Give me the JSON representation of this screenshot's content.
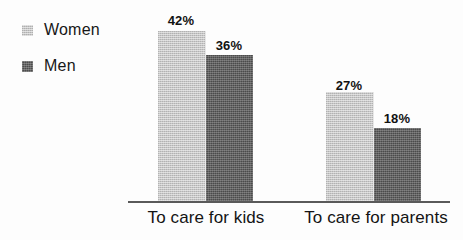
{
  "chart_data": {
    "type": "bar",
    "title": "",
    "subtitle": "",
    "xlabel": "",
    "ylabel": "",
    "grid": false,
    "legend_position": "top-left",
    "ylim": [
      0,
      45
    ],
    "categories": [
      "To care for kids",
      "To care for parents"
    ],
    "series": [
      {
        "name": "Women",
        "color": "#c6c6c6",
        "values": [
          42,
          27
        ],
        "value_labels": [
          "42%",
          "36%"
        ]
      },
      {
        "name": "Men",
        "color": "#4b4b4b",
        "values": [
          36,
          18
        ],
        "value_labels": [
          "27%",
          "18%"
        ]
      }
    ],
    "bars": [
      {
        "group": "To care for kids",
        "series": "Women",
        "value": 42,
        "label": "42%"
      },
      {
        "group": "To care for kids",
        "series": "Men",
        "value": 36,
        "label": "36%"
      },
      {
        "group": "To care for parents",
        "series": "Women",
        "value": 27,
        "label": "27%"
      },
      {
        "group": "To care for parents",
        "series": "Men",
        "value": 18,
        "label": "18%"
      }
    ]
  },
  "legend": {
    "items": [
      {
        "label": "Women",
        "swatch": "women-swatch-icon",
        "color": "#c6c6c6"
      },
      {
        "label": "Men",
        "swatch": "men-swatch-icon",
        "color": "#4b4b4b"
      }
    ]
  },
  "axis": {
    "category_labels": [
      "To care for kids",
      "To care for parents"
    ]
  },
  "values": {
    "kids_women": "42%",
    "kids_men": "36%",
    "parents_women": "27%",
    "parents_men": "18%"
  }
}
